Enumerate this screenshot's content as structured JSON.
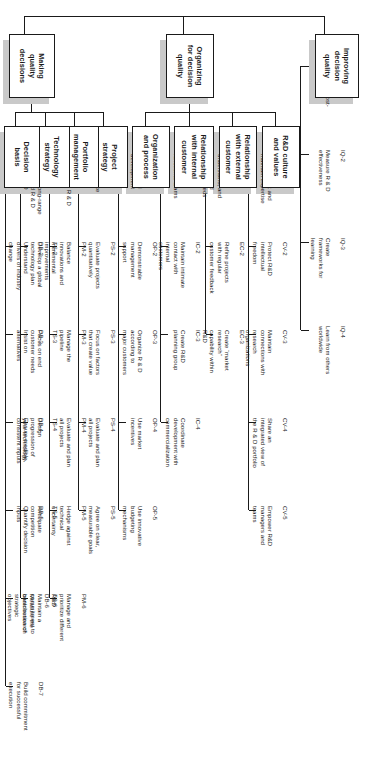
{
  "diagram": {
    "type": "hierarchy-tree",
    "orientation": "rotated-90",
    "colors": {
      "line": "#1a1a1a",
      "box_border": "#1a1a1a",
      "box_fill": "#ffffff",
      "shadow": "#c9c9c9",
      "text": "#1a1a1a"
    }
  },
  "roots": [
    {
      "id": "mqd",
      "label": "Making\nquality\ndecisions"
    },
    {
      "id": "ofdq",
      "label": "Organizing\nfor decision\nquality"
    },
    {
      "id": "idq",
      "label": "Improving\ndecision\nquality"
    }
  ],
  "branches": [
    {
      "id": "db",
      "parent": "mqd",
      "label": "Decision\nbasis",
      "items": [
        {
          "code": "DB-1",
          "text": "Frame R & D\ndecisions\nstrategically"
        },
        {
          "code": "DB-2",
          "text": "Understand\ndrivers of industry\nchange"
        },
        {
          "code": "DB-3",
          "text": "Insist on\nalternatives"
        },
        {
          "code": "DB-4",
          "text": "Ensure credible,\nconsistent inputs"
        },
        {
          "code": "DB-5",
          "text": "Quantify decision\ninputs"
        },
        {
          "code": "DB-6",
          "text": "Measure the\ncontribution of\nstrategic\nobjectives"
        },
        {
          "code": "DB-7",
          "text": "Build commitment\nfor successful\nexecution"
        }
      ]
    },
    {
      "id": "ts",
      "parent": "mqd",
      "label": "Technology\nstrategy",
      "items": [
        {
          "code": "TS-1",
          "text": "Coordinate long-range\nbusiness and R & D\nplans"
        },
        {
          "code": "TS-2",
          "text": "Develop a global\ntechnology plan"
        },
        {
          "code": "TS-3",
          "text": "Focus on end\ncustomer needs"
        },
        {
          "code": "TS-4",
          "text": "Design\nprogression of\nyour technology"
        },
        {
          "code": "TS-5",
          "text": "Anticipate\ncompetition"
        },
        {
          "code": "TS-6",
          "text": "Maintain a\ncommitment to\nbasic research"
        }
      ]
    },
    {
      "id": "pm",
      "parent": "mqd",
      "label": "Portfolio\nmanagement",
      "items": [
        {
          "code": "PM-1",
          "text": "Evaluate the R & D\nportfolio"
        },
        {
          "code": "PM-2",
          "text": "Balance\ninnovations and\nincremental\nimprovements"
        },
        {
          "code": "PM-3",
          "text": "Manage the\npipeline"
        },
        {
          "code": "PM-4",
          "text": "Evaluate and plan\nall projects"
        },
        {
          "code": "PM-5",
          "text": "Hedge against\ntechnical\nuncertainty"
        },
        {
          "code": "PM-6",
          "text": "Manage and\nprioritize different\nR&D"
        }
      ]
    },
    {
      "id": "ps",
      "parent": "mqd",
      "label": "Project\nstrategy",
      "items": [
        {
          "code": "PS-1",
          "text": "Fully resource\nprojects"
        },
        {
          "code": "PS-2",
          "text": "Evaluate projects\nquantitatively"
        },
        {
          "code": "PS-3",
          "text": "Focus on factors\nthat create value"
        },
        {
          "code": "PS-4",
          "text": "Evaluate and plan\nall projects"
        },
        {
          "code": "PS-5",
          "text": "Agree on clear,\nmeasurable goals"
        }
      ]
    },
    {
      "id": "op",
      "parent": "ofdq",
      "label": "Organization\nand process",
      "items": [
        {
          "code": "Op-1",
          "text": "Use a formal\ndevelopment\nprocess"
        },
        {
          "code": "OP-2",
          "text": "Demonstrable\nmanagement\nsupport"
        },
        {
          "code": "OP-3",
          "text": "Organize R & D\naccording to\nmajor customers"
        },
        {
          "code": "OP-4",
          "text": "Use market\nincentives"
        },
        {
          "code": "OP-5",
          "text": "Use innovative\nbudgeting\nmechanisms"
        }
      ]
    },
    {
      "id": "ic",
      "parent": "ofdq",
      "label": "Relationship\nwith internal\ncustomer",
      "items": [
        {
          "code": "IC-1",
          "text": "Use cross-\nfunctional teams"
        },
        {
          "code": "IC-2",
          "text": "Maintain intimate\ncontact with\ninternal\ncustomers"
        },
        {
          "code": "IC-3",
          "text": "Create R&D\nplanning group"
        },
        {
          "code": "IC-4",
          "text": "Coordinate\ndevelopment with\ncommercialization"
        }
      ]
    },
    {
      "id": "ec",
      "parent": "ofdq",
      "label": "Relationship\nwith external\ncustomer",
      "items": [
        {
          "code": "EC-1",
          "text": "Determine,\nunderstand, and\nmeasure and\ncustomer needs"
        },
        {
          "code": "EC-2",
          "text": "Refine projects\nwith regular\ncustomer feedback"
        },
        {
          "code": "EC-3",
          "text": "Create “market\nresearch”\ncapability within\nR&D"
        }
      ]
    },
    {
      "id": "cv",
      "parent": "ofdq",
      "label": "R&D culture\nand values",
      "items": [
        {
          "code": "CV-1",
          "text": "Hire the best and\nmaintain expertise"
        },
        {
          "code": "CV-2",
          "text": "Protect R&D\nintellectual\nfreedom"
        },
        {
          "code": "CV-3",
          "text": "Maintain\nconnections with\nresearch\norganizations"
        },
        {
          "code": "CV-4",
          "text": "Share an\nintegrated view of\nthe R & D portfolio"
        },
        {
          "code": "CV-5",
          "text": "Empower R&D\nmanagers and\nteams"
        }
      ]
    },
    {
      "id": "iq",
      "parent": "idq",
      "label": "",
      "items": [
        {
          "code": "IQ-1",
          "text": "Learn from post-\nproject audits"
        },
        {
          "code": "IQ-2",
          "text": "Measure R & D\neffectiveness"
        },
        {
          "code": "IQ-3",
          "text": "Create\nframeworks for\nlearning"
        },
        {
          "code": "IQ-4",
          "text": "Learn from others\nworldwide"
        }
      ]
    }
  ]
}
